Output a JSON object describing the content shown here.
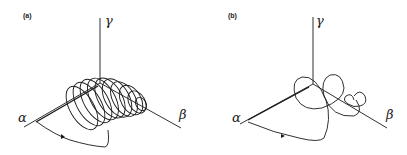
{
  "figure": {
    "panels": [
      {
        "id": "a",
        "label": "(a)",
        "axes": {
          "alpha": "α",
          "beta": "β",
          "gamma": "γ"
        },
        "description": "Trajectory spiralling in tight helical loops along the α–β axis"
      },
      {
        "id": "b",
        "label": "(b)",
        "axes": {
          "alpha": "α",
          "beta": "β",
          "gamma": "γ"
        },
        "description": "Trajectory with a few large loops of decreasing size along the α–β axis"
      }
    ],
    "colors": {
      "line": "#1a1a1a",
      "background": "#ffffff"
    }
  }
}
